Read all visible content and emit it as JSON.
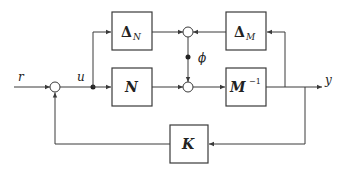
{
  "diagram": {
    "type": "block-diagram",
    "signals": {
      "r": "r",
      "u": "u",
      "y": "y",
      "phi": "ϕ"
    },
    "blocks": {
      "delta_n": {
        "symbol": "Δ",
        "sub": "N"
      },
      "n": {
        "symbol": "N"
      },
      "delta_m": {
        "symbol": "Δ",
        "sub": "M"
      },
      "m_inv": {
        "symbol": "M",
        "sup": "−1"
      },
      "k": {
        "symbol": "K"
      }
    },
    "colors": {
      "line": "#3a3a3a",
      "background": "#ffffff"
    }
  }
}
